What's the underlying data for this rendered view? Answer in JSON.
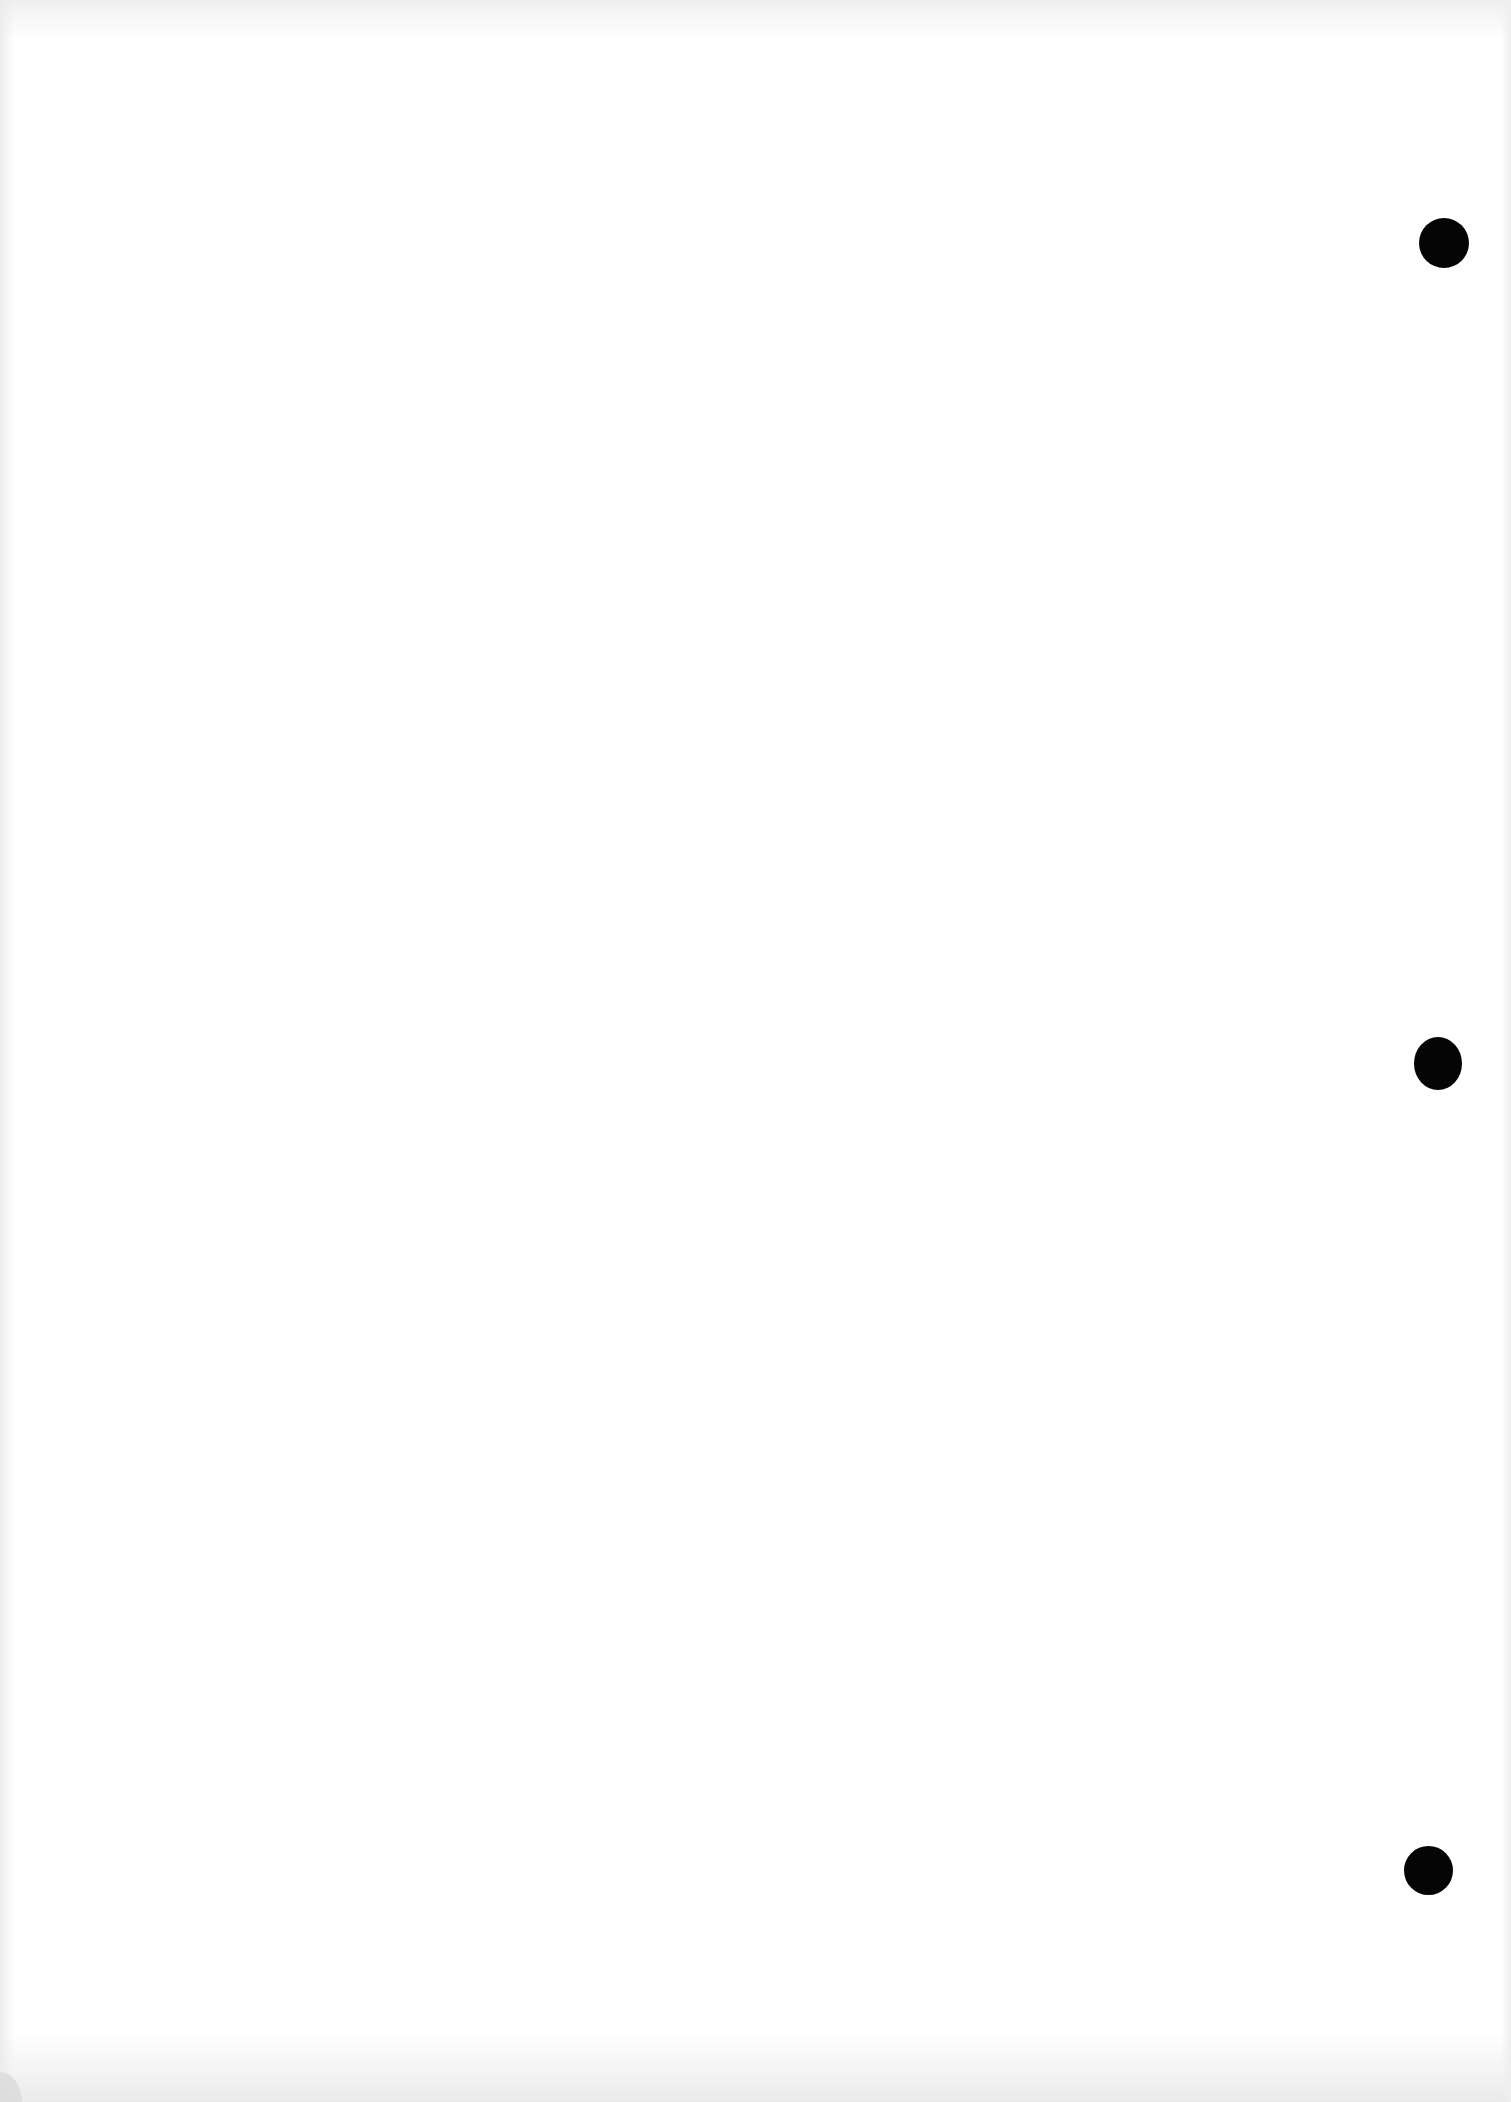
{
  "document": {
    "type": "scanned-blank-page",
    "background_color": "#ffffff",
    "edge_tint_color": "#ececec",
    "text": []
  },
  "punch_holes": [
    {
      "cx": 1444,
      "cy": 243,
      "w": 50,
      "h": 50,
      "color": "#050505"
    },
    {
      "cx": 1438,
      "cy": 1063,
      "w": 48,
      "h": 53,
      "color": "#050505"
    },
    {
      "cx": 1428,
      "cy": 1870,
      "w": 49,
      "h": 49,
      "color": "#050505"
    }
  ]
}
